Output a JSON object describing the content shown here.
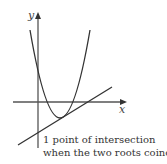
{
  "diagram": {
    "title": "",
    "axes": {
      "x_label": "x",
      "y_label": "y"
    },
    "curves": [
      {
        "name": "parabola",
        "type": "quadratic",
        "description": "upward-opening parabola with vertex below the x-axis"
      },
      {
        "name": "tangent-line",
        "type": "straight line",
        "description": "line touching the parabola at exactly one point"
      }
    ],
    "caption": {
      "line1": "1 point of intersection",
      "line2": "when the two roots coincide"
    },
    "colors": {
      "axis": "#555555",
      "curve": "#333333",
      "text": "#333333"
    }
  }
}
